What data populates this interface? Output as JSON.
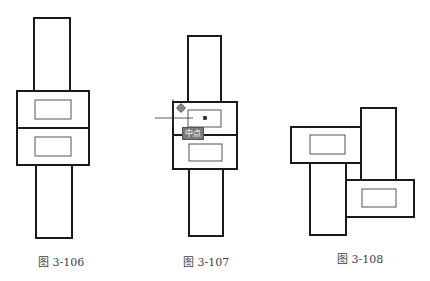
{
  "figures": [
    {
      "id": "fig-3-106",
      "caption": "图 3-106",
      "description": "Two stacked rectangles with inner rectangles, bars above and below"
    },
    {
      "id": "fig-3-107",
      "caption": "图 3-107",
      "description": "Snapping to midpoint of rectangle edge",
      "tooltip": "中点"
    },
    {
      "id": "fig-3-108",
      "caption": "图 3-108",
      "description": "Four rectangles arranged in pinwheel pattern"
    }
  ],
  "colors": {
    "stroke": "#1a1a1a",
    "inner_stroke": "#555555",
    "tooltip_bg": "#7a7a7a",
    "caption": "#444444"
  }
}
